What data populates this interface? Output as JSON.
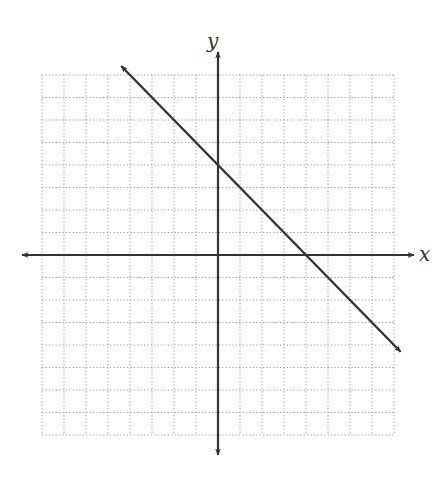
{
  "chart_data": {
    "type": "line",
    "title": "",
    "xlabel": "x",
    "ylabel": "y",
    "xlim": [
      -8,
      8
    ],
    "ylim": [
      -8,
      8
    ],
    "grid": true,
    "grid_style": "dotted",
    "grid_step": 1,
    "tick_labels": false,
    "legend": null,
    "series": [
      {
        "name": "line",
        "equation": "y = -x + 4",
        "slope": -1,
        "y_intercept": 4,
        "x_intercept": 4,
        "x": [
          -4.4,
          8.3
        ],
        "y": [
          8.4,
          -4.3
        ],
        "arrows_both_ends": true,
        "color": "#333333"
      }
    ],
    "axes": {
      "x_arrows_both_ends": true,
      "y_arrows_both_ends": true,
      "color": "#333333"
    }
  },
  "labels": {
    "x_axis": "x",
    "y_axis": "y"
  },
  "colors": {
    "grid": "#9a9a9a",
    "axis": "#333333",
    "line": "#333333",
    "background": "#ffffff"
  }
}
